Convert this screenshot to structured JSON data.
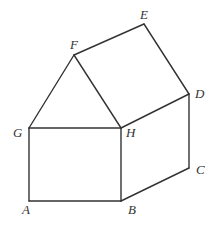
{
  "diagram": {
    "type": "geometric-figure",
    "vertices": {
      "A": {
        "x": 29,
        "y": 201,
        "label": "A",
        "lx": 22,
        "ly": 214
      },
      "B": {
        "x": 121,
        "y": 201,
        "label": "B",
        "lx": 128,
        "ly": 214
      },
      "C": {
        "x": 189,
        "y": 168,
        "label": "C",
        "lx": 196,
        "ly": 174
      },
      "D": {
        "x": 189,
        "y": 94,
        "label": "D",
        "lx": 195,
        "ly": 98
      },
      "E": {
        "x": 144,
        "y": 24,
        "label": "E",
        "lx": 140,
        "ly": 19
      },
      "F": {
        "x": 74,
        "y": 55,
        "label": "F",
        "lx": 70,
        "ly": 49
      },
      "G": {
        "x": 29,
        "y": 128,
        "label": "G",
        "lx": 13,
        "ly": 137
      },
      "H": {
        "x": 121,
        "y": 128,
        "label": "H",
        "lx": 126,
        "ly": 137
      }
    },
    "edges": [
      [
        "A",
        "B"
      ],
      [
        "B",
        "H"
      ],
      [
        "H",
        "G"
      ],
      [
        "G",
        "A"
      ],
      [
        "G",
        "F"
      ],
      [
        "F",
        "H"
      ],
      [
        "F",
        "E"
      ],
      [
        "E",
        "D"
      ],
      [
        "D",
        "H"
      ],
      [
        "D",
        "C"
      ],
      [
        "C",
        "B"
      ]
    ],
    "stroke_color": "#333333",
    "label_color": "#333333"
  }
}
